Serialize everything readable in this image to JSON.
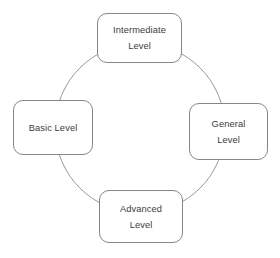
{
  "diagram": {
    "type": "cycle",
    "title": "",
    "colors": {
      "background": "#ffffff",
      "circle_stroke": "#9a9a9a",
      "box_stroke": "#868686",
      "box_fill": "#ffffff",
      "text": "#3b3b3b"
    },
    "circle": {
      "center_x": 140,
      "center_y": 128,
      "radius": 85,
      "stroke_width": 1
    },
    "nodes": [
      {
        "id": "intermediate",
        "position": "top",
        "lines": [
          "Intermediate",
          "Level"
        ],
        "label": "Intermediate Level"
      },
      {
        "id": "general",
        "position": "right",
        "lines": [
          "General",
          "Level"
        ],
        "label": "General Level"
      },
      {
        "id": "advanced",
        "position": "bottom",
        "lines": [
          "Advanced",
          "Level"
        ],
        "label": "Advanced Level"
      },
      {
        "id": "basic",
        "position": "left",
        "lines": [
          "Basic Level",
          ""
        ],
        "label": "Basic Level"
      }
    ]
  }
}
